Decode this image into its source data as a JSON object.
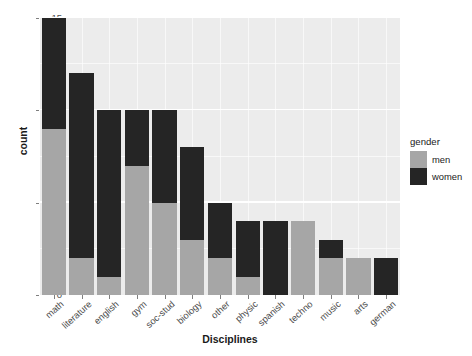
{
  "chart_data": {
    "type": "bar",
    "title": "",
    "xlabel": "Disciplines",
    "ylabel": "count",
    "stacked": true,
    "grid": true,
    "ylim": [
      0,
      15
    ],
    "yticks": [
      0,
      5,
      10,
      15
    ],
    "legend": {
      "title": "gender",
      "position": "right",
      "entries": [
        {
          "name": "men",
          "color": "#a6a6a6"
        },
        {
          "name": "women",
          "color": "#252525"
        }
      ]
    },
    "categories": [
      "math",
      "literature",
      "english",
      "gym",
      "soc-stud",
      "biology",
      "other",
      "physic",
      "spanish",
      "techno",
      "music",
      "arts",
      "german"
    ],
    "series": [
      {
        "name": "men",
        "color": "#a6a6a6",
        "values": [
          9,
          2,
          1,
          7,
          5,
          3,
          2,
          1,
          0,
          4,
          2,
          2,
          0
        ]
      },
      {
        "name": "women",
        "color": "#252525",
        "values": [
          6,
          10,
          9,
          3,
          5,
          5,
          3,
          3,
          4,
          0,
          1,
          0,
          2
        ]
      }
    ],
    "totals": [
      15,
      12,
      10,
      10,
      10,
      8,
      5,
      4,
      4,
      4,
      3,
      2,
      2
    ],
    "panel_background": "#ececec",
    "gridline_color": "#ffffff"
  },
  "axes": {
    "y_tick_labels": [
      "0",
      "5",
      "10",
      "15"
    ],
    "x_tick_labels": [
      "math",
      "literature",
      "english",
      "gym",
      "soc-stud",
      "biology",
      "other",
      "physic",
      "spanish",
      "techno",
      "music",
      "arts",
      "german"
    ]
  }
}
